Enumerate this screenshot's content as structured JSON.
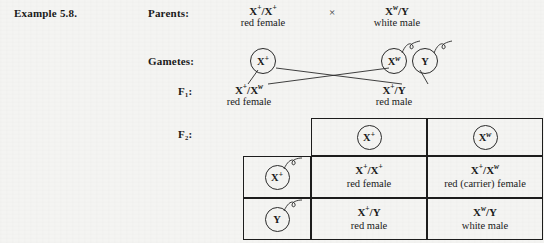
{
  "figure": {
    "example_label": "Example 5.8.",
    "row_labels": {
      "parents": "Parents:",
      "gametes": "Gametes:",
      "f1": "F₁:",
      "f2": "F₂:"
    },
    "cross_symbol": "×"
  },
  "parents": {
    "mother": {
      "genotype_base": "X",
      "genotype_sup": "+",
      "genotype_text": "X⁺/X⁺",
      "phenotype": "red female"
    },
    "father": {
      "genotype_text": "Xʷ/Y",
      "phenotype": "white male"
    }
  },
  "gametes": {
    "maternal": {
      "label": "X⁺"
    },
    "paternal_x": {
      "label": "Xʷ"
    },
    "paternal_y": {
      "label": "Y"
    }
  },
  "f1": {
    "daughter": {
      "genotype_text": "X⁺/Xʷ",
      "phenotype": "red female"
    },
    "son": {
      "genotype_text": "X⁺/Y",
      "phenotype": "red male"
    }
  },
  "punnett": {
    "column_headers": [
      "X⁺",
      "Xʷ"
    ],
    "row_headers": [
      "X⁺",
      "Y"
    ],
    "cells": [
      [
        {
          "genotype": "X⁺/X⁺",
          "phenotype": "red female"
        },
        {
          "genotype": "X⁺/Xʷ",
          "phenotype": "red (carrier) female"
        }
      ],
      [
        {
          "genotype": "X⁺/Y",
          "phenotype": "red male"
        },
        {
          "genotype": "Xʷ/Y",
          "phenotype": "white male"
        }
      ]
    ]
  },
  "colors": {
    "ink": "#1a1a1a",
    "paper": "#f4f4f2",
    "rule": "#1c1c1c"
  }
}
